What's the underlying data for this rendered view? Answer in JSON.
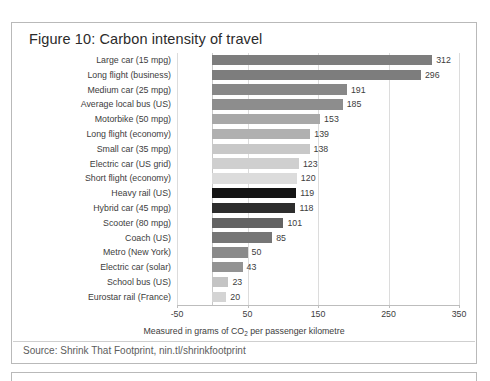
{
  "figure": {
    "title": "Figure 10: Carbon intensity of travel",
    "source": "Source: Shrink That Footprint, nin.tl/shrinkfootprint"
  },
  "chart_data": {
    "type": "bar",
    "orientation": "horizontal",
    "title": "Figure 10: Carbon intensity of travel",
    "xlabel": "Measured in grams of CO2 per passenger kilometre",
    "ylabel": "",
    "xlim": [
      -50,
      350
    ],
    "xticks": [
      -50,
      50,
      150,
      250,
      350
    ],
    "xtick_labels": [
      "-50",
      "50",
      "150",
      "250",
      "350"
    ],
    "grid": true,
    "grid_axis": "x",
    "legend": false,
    "categories": [
      "Large car (15 mpg)",
      "Long flight (business)",
      "Medium car (25 mpg)",
      "Average local bus (US)",
      "Motorbike (50 mpg)",
      "Long flight (economy)",
      "Small car (35 mpg)",
      "Electric car (US grid)",
      "Short flight (economy)",
      "Heavy rail (US)",
      "Hybrid car (45 mpg)",
      "Scooter (80 mpg)",
      "Coach (US)",
      "Metro (New York)",
      "Electric car (solar)",
      "School bus (US)",
      "Eurostar rail (France)"
    ],
    "values": [
      312,
      296,
      191,
      185,
      153,
      139,
      138,
      123,
      120,
      119,
      118,
      101,
      85,
      50,
      43,
      23,
      20
    ],
    "bar_colors": [
      "#7d7d7d",
      "#7d7d7d",
      "#888888",
      "#8d8d8d",
      "#a8a8a8",
      "#b0b0b0",
      "#c8c8c8",
      "#cfcfcf",
      "#dcdcdc",
      "#141414",
      "#2d2d2d",
      "#636363",
      "#767676",
      "#8a8a8a",
      "#939393",
      "#c4c4c4",
      "#d4d4d4"
    ],
    "value_labels": [
      "312",
      "296",
      "191",
      "185",
      "153",
      "139",
      "138",
      "123",
      "120",
      "119",
      "118",
      "101",
      "85",
      "50",
      "43",
      "23",
      "20"
    ]
  }
}
